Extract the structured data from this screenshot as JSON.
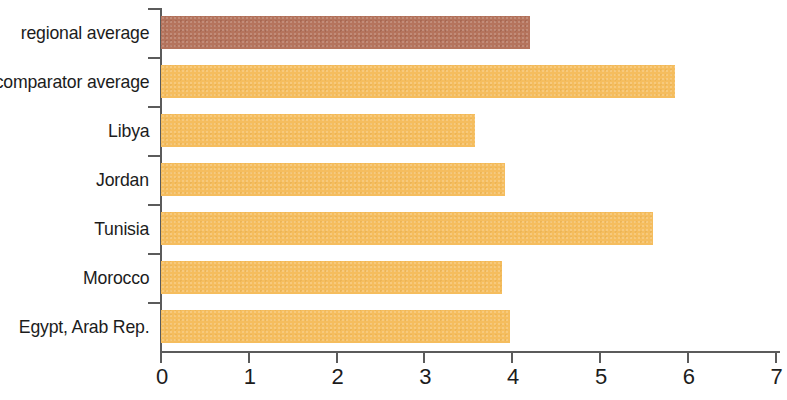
{
  "chart_data": {
    "type": "bar",
    "orientation": "horizontal",
    "title": "",
    "subtitle": "",
    "xlabel": "",
    "ylabel": "",
    "categories": [
      "regional average",
      "comparator average",
      "Libya",
      "Jordan",
      "Tunisia",
      "Morocco",
      "Egypt, Arab Rep."
    ],
    "values": [
      4.2,
      5.85,
      3.58,
      3.92,
      5.6,
      3.88,
      3.98
    ],
    "xlim": [
      0,
      7
    ],
    "xticks": [
      "0",
      "1",
      "2",
      "3",
      "4",
      "5",
      "6",
      "7"
    ],
    "xtick_values": [
      0,
      1,
      2,
      3,
      4,
      5,
      6,
      7
    ],
    "grid": false,
    "legend": null,
    "series": [
      {
        "name": "value",
        "values": [
          4.2,
          5.85,
          3.58,
          3.92,
          5.6,
          3.88,
          3.98
        ]
      }
    ],
    "bar_colors": [
      "#b5745d",
      "#f5bd5e",
      "#f5bd5e",
      "#f5bd5e",
      "#f5bd5e",
      "#f5bd5e",
      "#f5bd5e"
    ],
    "colors": {
      "bar_default": "#f5bd5e",
      "bar_highlight": "#b5745d",
      "axis": "#5b5b5b",
      "text": "#1c1c1c",
      "background": "#ffffff"
    }
  }
}
